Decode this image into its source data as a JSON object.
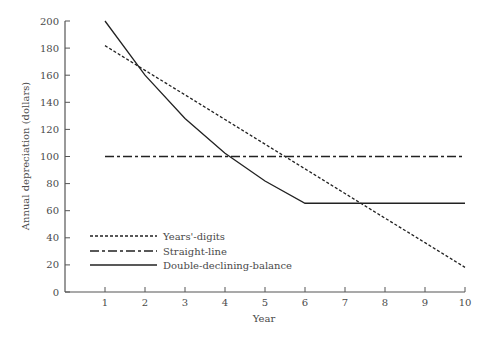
{
  "chart_data": {
    "type": "line",
    "title": "",
    "xlabel": "Year",
    "ylabel": "Annual depreciation (dollars)",
    "x": [
      1,
      2,
      3,
      4,
      5,
      6,
      7,
      8,
      9,
      10
    ],
    "xlim": [
      0,
      10
    ],
    "ylim": [
      0,
      200
    ],
    "x_ticks": [
      "1",
      "2",
      "3",
      "4",
      "5",
      "6",
      "7",
      "8",
      "9",
      "10"
    ],
    "y_ticks": [
      "0",
      "20",
      "40",
      "60",
      "80",
      "100",
      "120",
      "140",
      "160",
      "180",
      "200"
    ],
    "grid": false,
    "legend_position": "lower-left",
    "series": [
      {
        "name": "Years'-digits",
        "style": "dashed",
        "values": [
          181.8,
          163.6,
          145.5,
          127.3,
          109.1,
          90.9,
          72.7,
          54.5,
          36.4,
          18.2
        ]
      },
      {
        "name": "Straight-line",
        "style": "dash-dot",
        "values": [
          100,
          100,
          100,
          100,
          100,
          100,
          100,
          100,
          100,
          100
        ]
      },
      {
        "name": "Double-declining-balance",
        "style": "solid",
        "values": [
          200,
          160,
          128,
          102.4,
          81.9,
          65.5,
          65.5,
          65.5,
          65.5,
          65.5
        ]
      }
    ]
  },
  "legend": {
    "items": [
      "Years'-digits",
      "Straight-line",
      "Double-declining-balance"
    ]
  },
  "colors": {
    "line": "#222222",
    "axis": "#555555",
    "text": "#4a4a4a"
  }
}
